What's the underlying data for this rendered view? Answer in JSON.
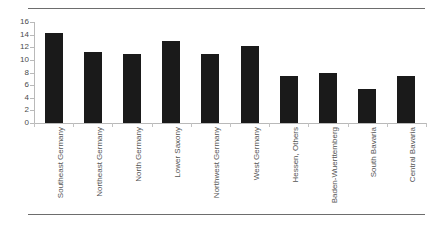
{
  "chart_data": {
    "type": "bar",
    "title": "",
    "subtitle": "",
    "xlabel": "",
    "ylabel": "",
    "ylim": [
      0,
      16
    ],
    "yticks": [
      0,
      2,
      4,
      6,
      8,
      10,
      12,
      14,
      16
    ],
    "grid": false,
    "legend": false,
    "bar_color": "#1a1a1a",
    "axis_color": "#b9b9b9",
    "categories": [
      "Southeast Germany",
      "Northeast Germany",
      "North Germany",
      "Lower Saxony",
      "Northwest Germany",
      "West Germany",
      "Hessen, Others",
      "Baden-Wuerttemberg",
      "South Bavaria",
      "Central Bavaria"
    ],
    "values": [
      14.3,
      11.2,
      11.0,
      13.0,
      11.0,
      12.2,
      7.4,
      8.0,
      5.4,
      7.4
    ]
  }
}
